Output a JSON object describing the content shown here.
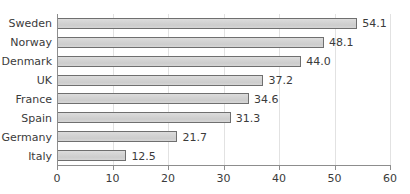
{
  "chart_data": {
    "type": "bar",
    "orientation": "horizontal",
    "title": "",
    "subtitle": "",
    "xlabel": "",
    "ylabel": "",
    "categories": [
      "Sweden",
      "Norway",
      "Denmark",
      "UK",
      "France",
      "Spain",
      "Germany",
      "Italy"
    ],
    "values": [
      54.1,
      48.1,
      44.0,
      37.2,
      34.6,
      31.3,
      21.7,
      12.5
    ],
    "value_labels": [
      "54.1",
      "48.1",
      "44.0",
      "37.2",
      "34.6",
      "31.3",
      "21.7",
      "12.5"
    ],
    "xlim": [
      0,
      60
    ],
    "xticks": [
      0,
      10,
      20,
      30,
      40,
      50,
      60
    ],
    "xtick_labels": [
      "0",
      "10",
      "20",
      "30",
      "40",
      "50",
      "60"
    ],
    "grid": true,
    "grid_axis": "x",
    "legend": null,
    "legend_position": "none",
    "bar_fill_color": "#d2d2d2",
    "bar_edge_color": "#6f6f6f",
    "gridline_color": "#e2e2e2",
    "axis_color": "#8d8d8d",
    "text_color": "#3b3b3b",
    "background_color": "#ffffff"
  }
}
